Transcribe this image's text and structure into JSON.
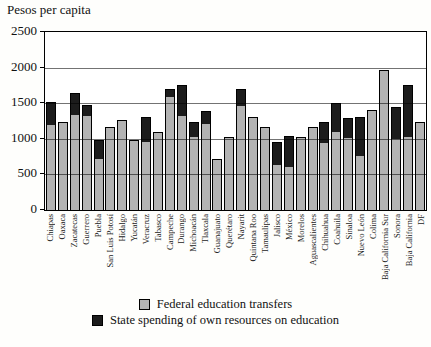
{
  "chart_data": {
    "type": "bar",
    "stacked": true,
    "title": "Pesos per capita",
    "xlabel": "",
    "ylabel": "Pesos per capita",
    "ylim": [
      0,
      2500
    ],
    "yticks": [
      0,
      500,
      1000,
      1500,
      2000,
      2500
    ],
    "grid": true,
    "legend_position": "bottom",
    "categories": [
      "Chiapas",
      "Oaxaca",
      "Zacatecas",
      "Guerrero",
      "Puebla",
      "San Luis Potosí",
      "Hidalgo",
      "Yucatán",
      "Veracruz",
      "Tabasco",
      "Campeche",
      "Durango",
      "Michoacán",
      "Tlaxcala",
      "Guanajuato",
      "Querétaro",
      "Nayarit",
      "Quintana Roo",
      "Tamaulipas",
      "Jalisco",
      "México",
      "Morelos",
      "Aguascalientes",
      "Chihuahua",
      "Coahuila",
      "Sinaloa",
      "Nuevo León",
      "Colima",
      "Baja California Sur",
      "Sonora",
      "Baja California",
      "DF"
    ],
    "series": [
      {
        "name": "Federal education transfers",
        "color": "#b3b3b3",
        "values": [
          1210,
          1240,
          1340,
          1340,
          730,
          1170,
          1270,
          980,
          970,
          1090,
          1600,
          1330,
          1040,
          1220,
          720,
          1030,
          1470,
          1310,
          1160,
          640,
          610,
          1020,
          1170,
          950,
          1110,
          1020,
          760,
          1410,
          1970,
          1010,
          1040,
          1240
        ]
      },
      {
        "name": "State spending of own resources on education",
        "color": "#1c1c1c",
        "values": [
          310,
          0,
          310,
          130,
          260,
          0,
          0,
          0,
          340,
          0,
          100,
          420,
          190,
          170,
          0,
          0,
          230,
          0,
          0,
          320,
          430,
          0,
          0,
          280,
          390,
          270,
          550,
          0,
          0,
          440,
          710,
          0
        ]
      }
    ]
  },
  "colors": {
    "bar_fill": "#b3b3b3",
    "bar_outline": "#000000",
    "state_fill": "#1c1c1c"
  }
}
